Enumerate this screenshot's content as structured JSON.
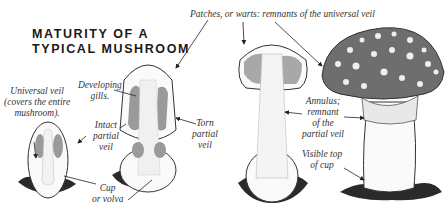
{
  "diagram": {
    "title_line1": "MATURITY OF A",
    "title_line2": "TYPICAL MUSHROOM",
    "labels": {
      "patches": "Patches, or warts: remnants of the universal veil",
      "universal_veil_1": "Universal veil",
      "universal_veil_2": "(covers the entire",
      "universal_veil_3": "mushroom).",
      "developing_gills_1": "Developing",
      "developing_gills_2": "gills.",
      "intact_veil_1": "Intact",
      "intact_veil_2": "partial",
      "intact_veil_3": "veil",
      "torn_veil_1": "Torn",
      "torn_veil_2": "partial",
      "torn_veil_3": "veil",
      "cup_1": "Cup",
      "cup_2": "or volva",
      "annulus_1": "Annulus;",
      "annulus_2": "remnant",
      "annulus_3": "of the",
      "annulus_4": "partial veil",
      "visible_cup_1": "Visible top",
      "visible_cup_2": "of cup"
    },
    "stages": [
      "egg",
      "button",
      "expanding",
      "mature"
    ],
    "colors": {
      "ink": "#333333",
      "cap": "#6e6e6e",
      "gill": "#9a9a9a",
      "spots": "#eeeeee",
      "ground": "#2a2a2a"
    }
  }
}
